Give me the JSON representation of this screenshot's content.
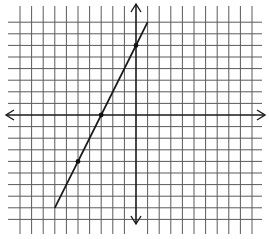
{
  "chart_data": {
    "type": "line",
    "title": "",
    "xlabel": "",
    "ylabel": "",
    "grid": true,
    "legend": null,
    "xlim": [
      -10,
      10
    ],
    "ylim": [
      -9,
      8
    ],
    "equation": "y = 2x + 6",
    "slope": 2,
    "y_intercept": 6,
    "x_intercept": -3,
    "series": [
      {
        "name": "line",
        "x": [
          -7,
          1
        ],
        "y": [
          -8,
          8
        ]
      }
    ],
    "marked_points": [
      {
        "x": -5,
        "y": -4
      },
      {
        "x": -3,
        "y": 0
      },
      {
        "x": 0,
        "y": 6
      }
    ]
  },
  "layout": {
    "origin_px": [
      136,
      115
    ],
    "unit_px": 11.6,
    "grid_x_left_px": 20,
    "grid_x_right_px": 252,
    "grid_y_top_px": 19,
    "grid_y_bottom_px": 223,
    "vline_top_px": 6,
    "vline_bottom_px": 234,
    "hline_left_px": 8,
    "hline_right_px": 262,
    "colors": {
      "grid": "#5a5a5a",
      "axis": "#1a1a1a",
      "line": "#1a1a1a",
      "background": "#ffffff"
    }
  }
}
